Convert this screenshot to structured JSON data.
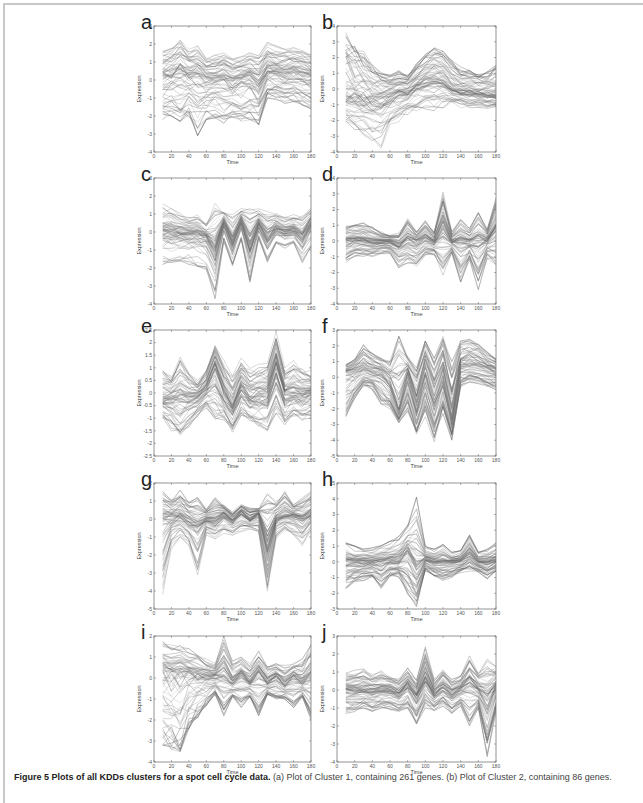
{
  "figure": {
    "caption_bold": "Figure 5 Plots of all KDDs clusters for a spot cell cycle data.",
    "caption_rest": " (a) Plot of Cluster 1, containing 261 genes. (b) Plot of Cluster 2, containing 86 genes."
  },
  "chart_data": [
    {
      "panel": "a",
      "type": "line",
      "xlabel": "Time",
      "ylabel": "Expression",
      "xlim": [
        0,
        180
      ],
      "ylim": [
        -4,
        3
      ],
      "xticks": [
        0,
        20,
        40,
        60,
        80,
        100,
        120,
        140,
        160,
        180
      ],
      "yticks": [
        -4,
        -3,
        -2,
        -1,
        0,
        1,
        2,
        3
      ],
      "x": [
        10,
        20,
        30,
        40,
        50,
        60,
        70,
        80,
        90,
        100,
        110,
        120,
        130,
        140,
        150,
        160,
        170,
        180
      ],
      "series": [
        {
          "name": "upper",
          "values": [
            1.6,
            1.8,
            2.3,
            1.7,
            1.9,
            1.2,
            1.4,
            1.5,
            1.2,
            1.3,
            1.6,
            1.4,
            2.1,
            1.9,
            1.7,
            1.8,
            1.7,
            1.4
          ]
        },
        {
          "name": "mean",
          "values": [
            0.1,
            0.2,
            0.4,
            0.2,
            0.3,
            0.0,
            0.0,
            0.1,
            -0.1,
            0.0,
            0.1,
            -0.3,
            0.5,
            0.4,
            0.3,
            0.4,
            0.3,
            0.2
          ]
        },
        {
          "name": "lower",
          "values": [
            -2.2,
            -2.0,
            -2.3,
            -2.1,
            -3.1,
            -2.2,
            -2.1,
            -2.4,
            -2.1,
            -2.3,
            -2.2,
            -2.5,
            -1.0,
            -1.1,
            -1.3,
            -1.2,
            -1.4,
            -1.6
          ]
        }
      ]
    },
    {
      "panel": "b",
      "type": "line",
      "xlabel": "Time",
      "ylabel": "Expression",
      "xlim": [
        0,
        180
      ],
      "ylim": [
        -4,
        4
      ],
      "xticks": [
        0,
        20,
        40,
        60,
        80,
        100,
        120,
        140,
        160,
        180
      ],
      "yticks": [
        -4,
        -3,
        -2,
        -1,
        0,
        1,
        2,
        3,
        4
      ],
      "x": [
        10,
        20,
        30,
        40,
        50,
        60,
        70,
        80,
        90,
        100,
        110,
        120,
        130,
        140,
        150,
        160,
        170,
        180
      ],
      "series": [
        {
          "name": "upper",
          "values": [
            3.8,
            3.0,
            2.4,
            1.6,
            1.2,
            0.9,
            1.2,
            1.0,
            1.6,
            2.2,
            2.7,
            2.4,
            1.8,
            1.4,
            1.2,
            1.0,
            1.1,
            1.5
          ]
        },
        {
          "name": "mean",
          "values": [
            -0.5,
            -0.6,
            -0.7,
            -0.8,
            -0.6,
            -0.5,
            -0.3,
            -0.2,
            0.2,
            0.5,
            0.6,
            0.5,
            0.0,
            -0.2,
            -0.2,
            -0.3,
            -0.4,
            -0.4
          ]
        },
        {
          "name": "lower",
          "values": [
            -2.4,
            -2.8,
            -3.2,
            -3.5,
            -3.9,
            -2.6,
            -2.2,
            -1.8,
            -1.6,
            -1.5,
            -1.6,
            -1.3,
            -1.1,
            -1.2,
            -1.4,
            -1.3,
            -1.4,
            -1.3
          ]
        }
      ]
    },
    {
      "panel": "c",
      "type": "line",
      "xlabel": "Time",
      "ylabel": "Expression",
      "xlim": [
        0,
        180
      ],
      "ylim": [
        -4,
        3
      ],
      "xticks": [
        0,
        20,
        40,
        60,
        80,
        100,
        120,
        140,
        160,
        180
      ],
      "yticks": [
        -4,
        -3,
        -2,
        -1,
        0,
        1,
        2,
        3
      ],
      "x": [
        10,
        20,
        30,
        40,
        50,
        60,
        70,
        80,
        90,
        100,
        110,
        120,
        130,
        140,
        150,
        160,
        170,
        180
      ],
      "series": [
        {
          "name": "upper",
          "values": [
            1.7,
            1.5,
            1.2,
            1.0,
            1.1,
            0.6,
            1.9,
            1.2,
            1.0,
            1.4,
            2.0,
            1.3,
            1.5,
            1.2,
            0.9,
            1.0,
            1.2,
            1.6
          ]
        },
        {
          "name": "mean",
          "values": [
            0.0,
            0.0,
            -0.1,
            -0.1,
            -0.1,
            -0.3,
            -1.0,
            0.6,
            -0.6,
            0.6,
            -0.8,
            0.5,
            -0.4,
            0.2,
            0.0,
            0.1,
            -0.3,
            0.5
          ]
        },
        {
          "name": "lower",
          "values": [
            -1.8,
            -1.7,
            -1.6,
            -1.8,
            -1.9,
            -2.1,
            -3.7,
            -0.5,
            -1.9,
            -0.4,
            -2.8,
            -0.4,
            -1.7,
            -0.6,
            -0.9,
            -0.6,
            -1.7,
            -0.8
          ]
        }
      ]
    },
    {
      "panel": "d",
      "type": "line",
      "xlabel": "Time",
      "ylabel": "Expression",
      "xlim": [
        0,
        180
      ],
      "ylim": [
        -4,
        4
      ],
      "xticks": [
        0,
        20,
        40,
        60,
        80,
        100,
        120,
        140,
        160,
        180
      ],
      "yticks": [
        -4,
        -3,
        -2,
        -1,
        0,
        1,
        2,
        3,
        4
      ],
      "x": [
        10,
        20,
        30,
        40,
        50,
        60,
        70,
        80,
        90,
        100,
        110,
        120,
        130,
        140,
        150,
        160,
        170,
        180
      ],
      "series": [
        {
          "name": "upper",
          "values": [
            1.0,
            1.1,
            1.2,
            0.9,
            0.6,
            0.4,
            0.5,
            1.5,
            0.6,
            1.3,
            0.6,
            3.1,
            0.6,
            1.4,
            0.8,
            1.8,
            0.8,
            3.0
          ]
        },
        {
          "name": "mean",
          "values": [
            0.0,
            0.1,
            0.1,
            0.0,
            0.0,
            0.0,
            -0.2,
            0.2,
            0.0,
            0.3,
            0.0,
            1.0,
            0.0,
            0.1,
            0.0,
            0.1,
            0.1,
            0.8
          ]
        },
        {
          "name": "lower",
          "values": [
            -1.5,
            -1.0,
            -1.0,
            -1.0,
            -0.8,
            -0.8,
            -1.7,
            -1.5,
            -1.6,
            -0.9,
            -0.9,
            -2.3,
            -0.8,
            -2.6,
            -1.2,
            -3.1,
            -1.1,
            -1.5
          ]
        }
      ]
    },
    {
      "panel": "e",
      "type": "line",
      "xlabel": "Time",
      "ylabel": "Expression",
      "xlim": [
        0,
        180
      ],
      "ylim": [
        -2.5,
        2.5
      ],
      "xticks": [
        0,
        20,
        40,
        60,
        80,
        100,
        120,
        140,
        160,
        180
      ],
      "yticks": [
        -2.5,
        -2,
        -1.5,
        -1,
        -0.5,
        0,
        0.5,
        1,
        1.5,
        2,
        2.5
      ],
      "x": [
        10,
        20,
        30,
        40,
        50,
        60,
        70,
        80,
        90,
        100,
        110,
        120,
        130,
        140,
        150,
        160,
        170,
        180
      ],
      "series": [
        {
          "name": "upper",
          "values": [
            1.1,
            0.8,
            1.6,
            1.0,
            0.6,
            1.0,
            2.0,
            1.3,
            0.8,
            1.5,
            1.1,
            1.2,
            1.3,
            2.5,
            1.0,
            1.3,
            1.1,
            0.9
          ]
        },
        {
          "name": "mean",
          "values": [
            -0.2,
            -0.1,
            0.0,
            -0.1,
            -0.1,
            0.3,
            1.1,
            0.1,
            -0.5,
            0.3,
            -0.1,
            0.0,
            0.1,
            1.2,
            0.0,
            0.1,
            0.0,
            0.1
          ]
        },
        {
          "name": "lower",
          "values": [
            -1.1,
            -1.5,
            -2.0,
            -1.4,
            -1.0,
            -0.6,
            -1.4,
            -1.2,
            -1.6,
            -0.9,
            -1.2,
            -1.4,
            -1.6,
            -0.8,
            -1.3,
            -1.0,
            -1.2,
            -1.0
          ]
        }
      ]
    },
    {
      "panel": "f",
      "type": "line",
      "xlabel": "Time",
      "ylabel": "Expression",
      "xlim": [
        0,
        180
      ],
      "ylim": [
        -5,
        3
      ],
      "xticks": [
        0,
        20,
        40,
        60,
        80,
        100,
        120,
        140,
        160,
        180
      ],
      "yticks": [
        -5,
        -4,
        -3,
        -2,
        -1,
        0,
        1,
        2,
        3
      ],
      "x": [
        10,
        20,
        30,
        40,
        50,
        60,
        70,
        80,
        90,
        100,
        110,
        120,
        130,
        140,
        150,
        160,
        170,
        180
      ],
      "series": [
        {
          "name": "upper",
          "values": [
            0.8,
            1.2,
            2.1,
            1.5,
            1.2,
            1.0,
            2.6,
            1.3,
            0.6,
            2.3,
            1.2,
            2.6,
            1.0,
            2.3,
            2.4,
            2.1,
            1.6,
            1.2
          ]
        },
        {
          "name": "mean",
          "values": [
            0.3,
            0.4,
            0.6,
            0.4,
            0.3,
            -0.4,
            -2.0,
            0.2,
            -1.8,
            0.5,
            -1.5,
            0.3,
            -2.5,
            0.8,
            0.9,
            0.8,
            0.6,
            0.4
          ]
        },
        {
          "name": "lower",
          "values": [
            -2.5,
            -1.5,
            -0.6,
            -0.8,
            -1.7,
            -2.0,
            -2.9,
            -2.2,
            -3.6,
            -2.5,
            -4.1,
            -2.3,
            -4.0,
            -0.6,
            -0.3,
            -0.4,
            -0.6,
            -0.8
          ]
        }
      ]
    },
    {
      "panel": "g",
      "type": "line",
      "xlabel": "Time",
      "ylabel": "Expression",
      "xlim": [
        0,
        180
      ],
      "ylim": [
        -5,
        2
      ],
      "xticks": [
        0,
        20,
        40,
        60,
        80,
        100,
        120,
        140,
        160,
        180
      ],
      "yticks": [
        -5,
        -4,
        -3,
        -2,
        -1,
        0,
        1,
        2
      ],
      "x": [
        10,
        20,
        30,
        40,
        50,
        60,
        70,
        80,
        90,
        100,
        110,
        120,
        130,
        140,
        150,
        160,
        170,
        180
      ],
      "series": [
        {
          "name": "upper",
          "values": [
            1.6,
            1.2,
            1.6,
            1.0,
            1.2,
            0.6,
            1.2,
            0.8,
            0.4,
            0.8,
            0.6,
            0.6,
            1.4,
            1.0,
            1.6,
            0.8,
            1.2,
            1.6
          ]
        },
        {
          "name": "mean",
          "values": [
            0.0,
            0.1,
            0.2,
            -0.1,
            -0.4,
            0.0,
            -0.1,
            0.3,
            -0.1,
            0.4,
            0.0,
            0.3,
            -1.5,
            0.0,
            0.2,
            0.2,
            0.0,
            0.3
          ]
        },
        {
          "name": "lower",
          "values": [
            -4.2,
            -1.7,
            -1.0,
            -1.5,
            -3.1,
            -0.9,
            -1.1,
            -0.8,
            -0.9,
            -0.7,
            -0.6,
            -0.8,
            -4.1,
            -1.1,
            -0.7,
            -0.9,
            -1.5,
            -0.7
          ]
        }
      ]
    },
    {
      "panel": "h",
      "type": "line",
      "xlabel": "Time",
      "ylabel": "Expression",
      "xlim": [
        0,
        180
      ],
      "ylim": [
        -3,
        5
      ],
      "xticks": [
        0,
        20,
        40,
        60,
        80,
        100,
        120,
        140,
        160,
        180
      ],
      "yticks": [
        -3,
        -2,
        -1,
        0,
        1,
        2,
        3,
        4,
        5
      ],
      "x": [
        10,
        20,
        30,
        40,
        50,
        60,
        70,
        80,
        90,
        100,
        110,
        120,
        130,
        140,
        150,
        160,
        170,
        180
      ],
      "series": [
        {
          "name": "upper",
          "values": [
            1.4,
            1.0,
            0.8,
            0.9,
            1.1,
            1.3,
            1.6,
            2.4,
            4.1,
            1.0,
            0.8,
            1.1,
            0.6,
            0.7,
            1.8,
            0.6,
            0.8,
            1.2
          ]
        },
        {
          "name": "mean",
          "values": [
            0.0,
            0.0,
            0.0,
            0.0,
            0.0,
            0.1,
            0.1,
            0.7,
            -0.3,
            0.2,
            0.0,
            0.0,
            0.0,
            0.1,
            0.6,
            0.0,
            0.0,
            0.1
          ]
        },
        {
          "name": "lower",
          "values": [
            -1.7,
            -1.3,
            -1.2,
            -1.1,
            -1.7,
            -1.0,
            -1.0,
            -2.2,
            -2.9,
            -0.6,
            -1.0,
            -1.2,
            -1.0,
            -0.7,
            -0.6,
            -0.7,
            -1.1,
            -0.6
          ]
        }
      ]
    },
    {
      "panel": "i",
      "type": "line",
      "xlabel": "Time",
      "ylabel": "Expression",
      "xlim": [
        0,
        180
      ],
      "ylim": [
        -4,
        2
      ],
      "xticks": [
        0,
        20,
        40,
        60,
        80,
        100,
        120,
        140,
        160,
        180
      ],
      "yticks": [
        -4,
        -3,
        -2,
        -1,
        0,
        1,
        2
      ],
      "x": [
        10,
        20,
        30,
        40,
        50,
        60,
        70,
        80,
        90,
        100,
        110,
        120,
        130,
        140,
        150,
        160,
        170,
        180
      ],
      "series": [
        {
          "name": "upper",
          "values": [
            1.8,
            1.6,
            1.6,
            1.4,
            1.2,
            0.9,
            0.7,
            2.0,
            0.8,
            1.0,
            0.7,
            1.3,
            0.6,
            0.7,
            0.6,
            0.7,
            0.9,
            1.7
          ]
        },
        {
          "name": "mean",
          "values": [
            0.4,
            0.3,
            0.3,
            0.3,
            0.2,
            0.1,
            0.1,
            0.3,
            -0.2,
            0.2,
            -0.2,
            0.3,
            -0.2,
            0.1,
            -0.3,
            0.1,
            -0.2,
            0.2
          ]
        },
        {
          "name": "lower",
          "values": [
            -3.2,
            -3.4,
            -3.5,
            -2.4,
            -1.9,
            -1.3,
            -0.8,
            -1.8,
            -0.9,
            -1.4,
            -0.9,
            -1.8,
            -0.8,
            -1.0,
            -1.0,
            -1.4,
            -0.9,
            -2.0
          ]
        }
      ]
    },
    {
      "panel": "j",
      "type": "line",
      "xlabel": "Time",
      "ylabel": "Expression",
      "xlim": [
        0,
        180
      ],
      "ylim": [
        -4,
        3
      ],
      "xticks": [
        0,
        20,
        40,
        60,
        80,
        100,
        120,
        140,
        160,
        180
      ],
      "yticks": [
        -4,
        -3,
        -2,
        -1,
        0,
        1,
        2,
        3
      ],
      "x": [
        10,
        20,
        30,
        40,
        50,
        60,
        70,
        80,
        90,
        100,
        110,
        120,
        130,
        140,
        150,
        160,
        170,
        180
      ],
      "series": [
        {
          "name": "upper",
          "values": [
            1.0,
            1.1,
            1.2,
            0.9,
            1.1,
            0.8,
            0.7,
            1.3,
            0.6,
            2.4,
            0.6,
            1.2,
            0.6,
            0.8,
            1.9,
            1.0,
            1.7,
            1.3
          ]
        },
        {
          "name": "mean",
          "values": [
            0.0,
            0.0,
            0.0,
            -0.1,
            0.0,
            0.0,
            -0.2,
            0.3,
            -0.3,
            0.7,
            -0.2,
            0.2,
            -0.2,
            0.1,
            0.5,
            0.0,
            -0.5,
            0.2
          ]
        },
        {
          "name": "lower",
          "values": [
            -1.3,
            -1.2,
            -1.0,
            -1.2,
            -1.0,
            -1.1,
            -1.2,
            -1.0,
            -1.9,
            -1.0,
            -1.2,
            -0.9,
            -1.3,
            -0.9,
            -2.0,
            -1.0,
            -3.7,
            -1.2
          ]
        }
      ]
    }
  ]
}
